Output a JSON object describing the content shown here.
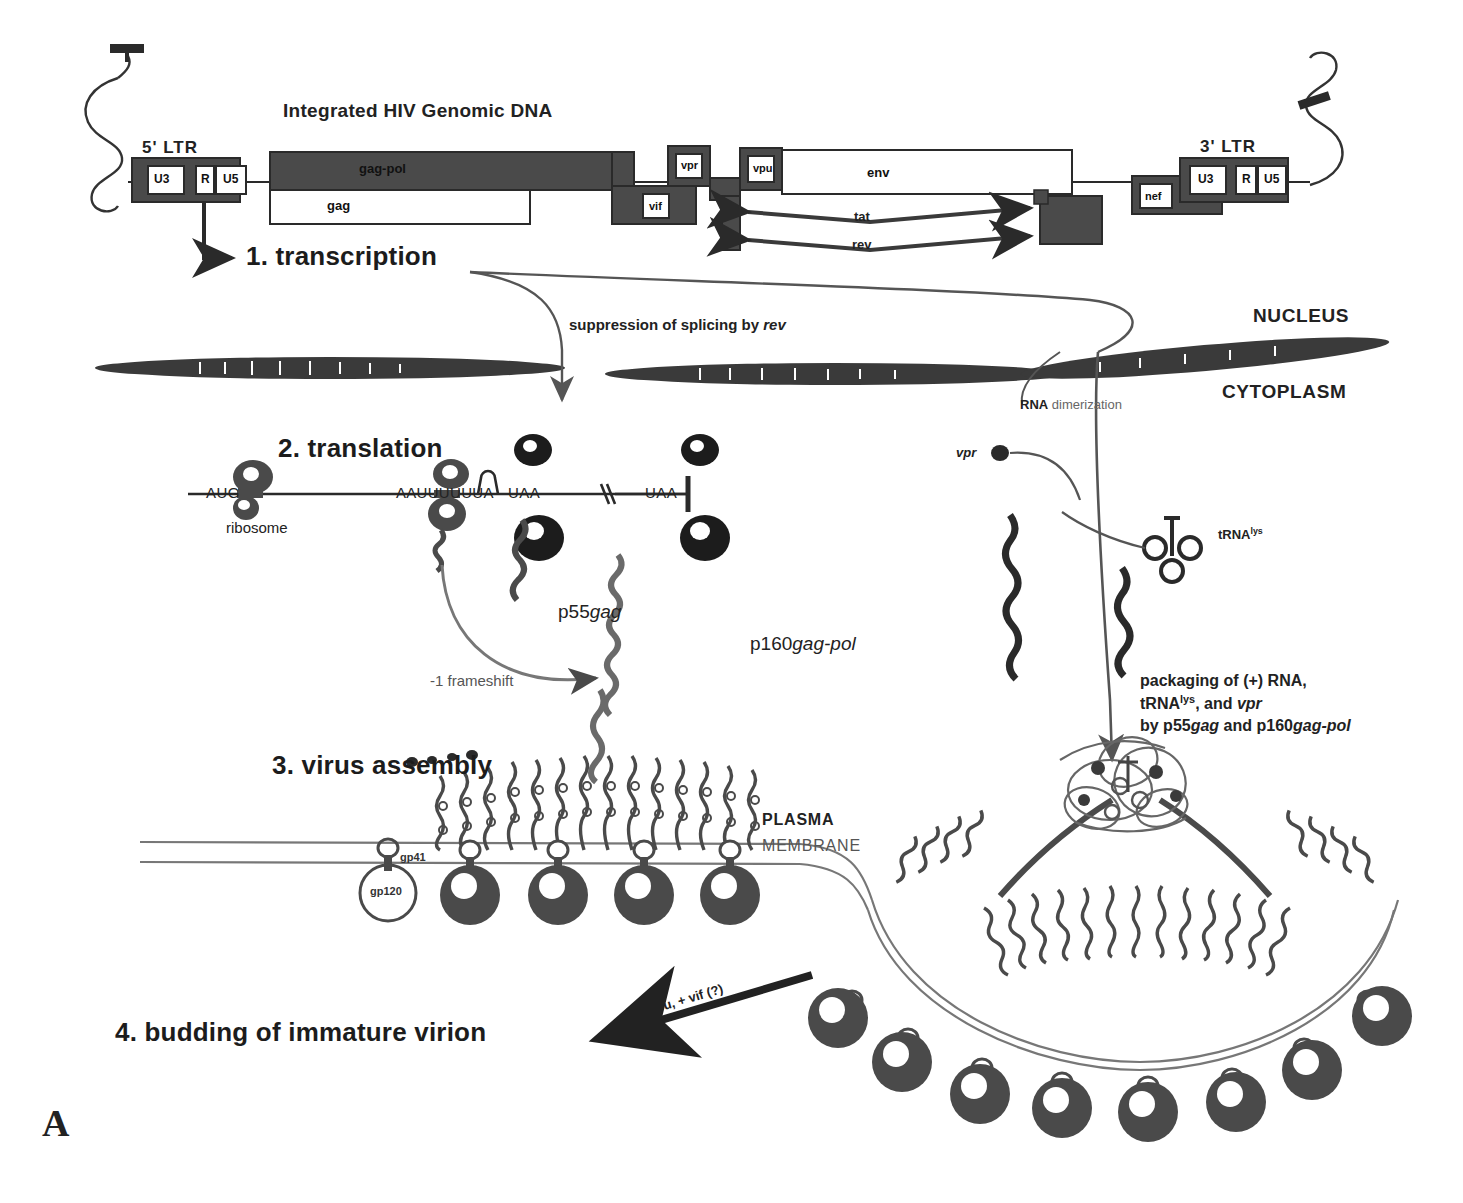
{
  "figure": {
    "panel_letter": "A",
    "title": "Integrated HIV Genomic DNA"
  },
  "genome": {
    "ltr5_label": "5' LTR",
    "ltr3_label": "3' LTR",
    "ltr5_segments": [
      "U3",
      "R",
      "U5"
    ],
    "ltr3_segments": [
      "U3",
      "R",
      "U5"
    ],
    "genes": [
      {
        "name": "gag-pol"
      },
      {
        "name": "gag"
      },
      {
        "name": "vif"
      },
      {
        "name": "vpr"
      },
      {
        "name": "vpu"
      },
      {
        "name": "env"
      },
      {
        "name": "nef"
      }
    ],
    "spliced_arrows": [
      {
        "label": "tat"
      },
      {
        "label": "rev"
      }
    ]
  },
  "steps": [
    {
      "id": "step-1",
      "label": "1. transcription"
    },
    {
      "id": "step-2",
      "label": "2. translation"
    },
    {
      "id": "step-3",
      "label": "3. virus assembly"
    },
    {
      "id": "step-4",
      "label": "4. budding of immature virion"
    }
  ],
  "annotations": {
    "splicing_suppression": "suppression of splicing by rev",
    "splicing_suppression_plain": "suppression of splicing by ",
    "splicing_suppression_italic": "rev",
    "nucleus": "NUCLEUS",
    "cytoplasm": "CYTOPLASM",
    "rna_dimerization_bold": "RNA",
    "rna_dimerization_rest": " dimerization",
    "vpr_particle": "vpr",
    "trna_lys_base": "tRNA",
    "trna_lys_sup": "lys",
    "frameshift": "-1 frameshift",
    "plasma": "PLASMA",
    "membrane": "MEMBRANE",
    "gp41": "gp41",
    "gp120": "gp120",
    "budding_arrow": "+ vpu, + vif (?)"
  },
  "mrna": {
    "start_codon": "AUG",
    "ribosome_label": "ribosome",
    "slip_site": "AAUUUUUUA",
    "stop_codon_1": "UAA",
    "stop_codon_2": "UAA"
  },
  "proteins": {
    "p55_num": "p55",
    "p55_gene": "gag",
    "p160_num": "p160",
    "p160_gene": "gag-pol"
  },
  "packaging_text": {
    "line1": "packaging of (+) RNA,",
    "line2_base": "tRNA",
    "line2_sup": "lys",
    "line2_rest": ", and ",
    "line2_italic": "vpr",
    "line3_pre": "by p55",
    "line3_gene1": "gag",
    "line3_mid": "  and p160",
    "line3_gene2": "gag-pol"
  },
  "colors": {
    "ink": "#1a1a1a",
    "fill_dark": "#4a4a4a",
    "fill_mid": "#6e6e6e",
    "background": "#ffffff",
    "line": "#2a2a2a"
  }
}
